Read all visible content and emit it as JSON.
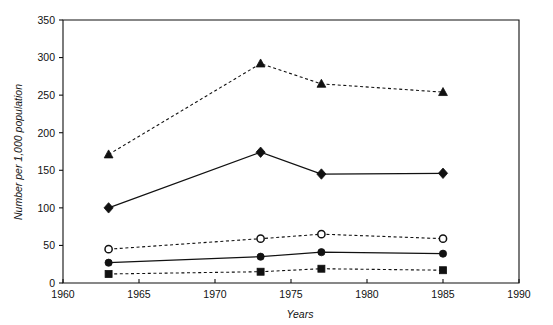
{
  "chart_data": {
    "type": "line",
    "title": "",
    "xlabel": "Years",
    "ylabel": "Number per 1,000 population",
    "x": [
      1963,
      1973,
      1977,
      1985
    ],
    "xlim": [
      1960,
      1990
    ],
    "ylim": [
      0,
      350
    ],
    "xticks": [
      1960,
      1965,
      1970,
      1975,
      1980,
      1985,
      1990
    ],
    "xtick_labels": [
      "1960",
      "1965",
      "1970",
      "1975",
      "1980",
      "1985",
      "1990"
    ],
    "yticks": [
      0,
      50,
      100,
      150,
      200,
      250,
      300,
      350
    ],
    "ytick_labels": [
      "0",
      "50",
      "100",
      "150",
      "200",
      "250",
      "300",
      "350"
    ],
    "grid": false,
    "legend": "none",
    "series": [
      {
        "name": "series-triangle-dashed",
        "marker": "filled-triangle",
        "linestyle": "dashed",
        "color": "#111111",
        "values": [
          171,
          292,
          265,
          254
        ]
      },
      {
        "name": "series-diamond-solid",
        "marker": "filled-diamond",
        "linestyle": "solid",
        "color": "#111111",
        "values": [
          100,
          174,
          145,
          146
        ]
      },
      {
        "name": "series-open-circle-dashed",
        "marker": "open-circle",
        "linestyle": "dashed",
        "color": "#111111",
        "values": [
          45,
          59,
          65,
          59
        ]
      },
      {
        "name": "series-filled-circle-solid",
        "marker": "filled-circle",
        "linestyle": "solid",
        "color": "#111111",
        "values": [
          27,
          35,
          41,
          39
        ]
      },
      {
        "name": "series-filled-square-dashed",
        "marker": "filled-square",
        "linestyle": "dashed",
        "color": "#111111",
        "values": [
          12,
          15,
          19,
          17
        ]
      }
    ]
  },
  "figure": {
    "background": "#ffffff",
    "axis_color": "#111111"
  }
}
